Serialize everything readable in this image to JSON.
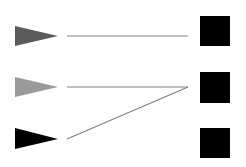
{
  "diagram": {
    "type": "matching",
    "left_items": [
      {
        "shape": "triangle",
        "color": "#5a5a5a",
        "y": 36
      },
      {
        "shape": "triangle",
        "color": "#9a9a9a",
        "y": 87
      },
      {
        "shape": "triangle",
        "color": "#000000",
        "y": 139
      }
    ],
    "right_items": [
      {
        "shape": "square",
        "color": "#000000",
        "y": 31
      },
      {
        "shape": "square",
        "color": "#000000",
        "y": 88
      },
      {
        "shape": "square",
        "color": "#000000",
        "y": 143
      }
    ],
    "connections": [
      {
        "from": 0,
        "to": 0
      },
      {
        "from": 1,
        "to": 1
      },
      {
        "from": 2,
        "to": 1
      }
    ],
    "line_color": "#808080"
  }
}
